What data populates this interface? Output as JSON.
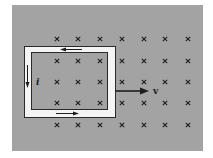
{
  "figure": {
    "colors": {
      "background": "#ffffff",
      "field_region": "#a3a3a3",
      "loop_band": "#f4f4f4",
      "ink": "#1e1e1e"
    },
    "field": {
      "symbol": "×",
      "direction": "into-page",
      "columns_x": [
        57,
        78,
        100,
        122,
        144,
        165,
        188
      ],
      "rows_y": [
        39,
        61,
        82,
        103,
        125
      ]
    },
    "loop": {
      "current_label": "i",
      "current_direction": "counterclockwise"
    },
    "velocity": {
      "label": "v",
      "direction": "right"
    }
  }
}
